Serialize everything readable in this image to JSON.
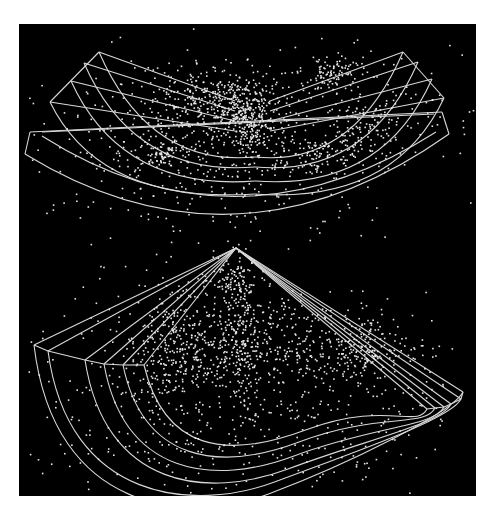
{
  "figure": {
    "background": "#000000",
    "wire_color": "#d8d8d8",
    "point_color": "#e6e6e6",
    "panel": {
      "x": 19,
      "y": 24,
      "width": 457,
      "height": 472
    }
  },
  "top_diagram": {
    "description": "Two intersecting 3D wedge slices of a galaxy redshift survey (V-shaped)",
    "apex": [
      236,
      82
    ],
    "left_wedge": {
      "outer_corners": [
        [
          80,
          28
        ],
        [
          65,
          39
        ],
        [
          52,
          57
        ],
        [
          31,
          78
        ]
      ],
      "inner_arcs_ctrl_y": [
        123,
        133,
        147,
        160
      ]
    },
    "right_wedge": {
      "outer_corners": [
        [
          384,
          28
        ],
        [
          399,
          38
        ],
        [
          413,
          55
        ],
        [
          425,
          74
        ]
      ],
      "inner_arcs_ctrl_y": [
        123,
        133,
        147,
        160
      ]
    },
    "front_wedge": {
      "left_end": [
        [
          11,
          108
        ],
        [
          6,
          130
        ]
      ],
      "right_end": [
        [
          423,
          88
        ],
        [
          430,
          110
        ]
      ],
      "arc_bottom_y": [
        190,
        205
      ]
    },
    "clusters": [
      {
        "cx": 218,
        "cy": 80,
        "sx": 22,
        "sy": 16,
        "n": 260
      },
      {
        "cx": 230,
        "cy": 100,
        "sx": 10,
        "sy": 14,
        "n": 120
      },
      {
        "cx": 175,
        "cy": 72,
        "sx": 28,
        "sy": 14,
        "n": 140
      },
      {
        "cx": 310,
        "cy": 46,
        "sx": 14,
        "sy": 8,
        "n": 80
      },
      {
        "cx": 145,
        "cy": 130,
        "sx": 14,
        "sy": 8,
        "n": 60
      },
      {
        "cx": 295,
        "cy": 130,
        "sx": 30,
        "sy": 10,
        "n": 110
      },
      {
        "cx": 345,
        "cy": 103,
        "sx": 14,
        "sy": 12,
        "n": 60
      },
      {
        "cx": 215,
        "cy": 130,
        "sx": 90,
        "sy": 40,
        "n": 340
      },
      {
        "cx": 150,
        "cy": 110,
        "sx": 70,
        "sy": 30,
        "n": 160
      },
      {
        "cx": 330,
        "cy": 85,
        "sx": 60,
        "sy": 30,
        "n": 160
      }
    ]
  },
  "bottom_diagram": {
    "description": "Fan-shaped stack of redshift survey slices viewed in perspective",
    "apex": [
      217,
      224
    ],
    "shells": [
      {
        "left": [
          15,
          321
        ],
        "right": [
          444,
          368
        ],
        "bottom_y": 500
      },
      {
        "left": [
          29,
          327
        ],
        "right": [
          442,
          375
        ],
        "bottom_y": 488
      },
      {
        "left": [
          66,
          336
        ],
        "right": [
          432,
          380
        ],
        "bottom_y": 475
      },
      {
        "left": [
          85,
          340
        ],
        "right": [
          425,
          383
        ],
        "bottom_y": 462
      },
      {
        "left": [
          104,
          341
        ],
        "right": [
          416,
          384
        ],
        "bottom_y": 448
      },
      {
        "left": [
          125,
          341
        ],
        "right": [
          408,
          385
        ],
        "bottom_y": 436
      }
    ],
    "clusters": [
      {
        "cx": 220,
        "cy": 300,
        "sx": 8,
        "sy": 45,
        "n": 170
      },
      {
        "cx": 198,
        "cy": 330,
        "sx": 40,
        "sy": 18,
        "n": 200
      },
      {
        "cx": 160,
        "cy": 305,
        "sx": 22,
        "sy": 25,
        "n": 150
      },
      {
        "cx": 320,
        "cy": 330,
        "sx": 40,
        "sy": 14,
        "n": 170
      },
      {
        "cx": 345,
        "cy": 320,
        "sx": 10,
        "sy": 18,
        "n": 70
      },
      {
        "cx": 210,
        "cy": 255,
        "sx": 14,
        "sy": 10,
        "n": 80
      },
      {
        "cx": 260,
        "cy": 300,
        "sx": 30,
        "sy": 20,
        "n": 100
      },
      {
        "cx": 230,
        "cy": 360,
        "sx": 110,
        "sy": 50,
        "n": 380
      },
      {
        "cx": 230,
        "cy": 410,
        "sx": 120,
        "sy": 30,
        "n": 160
      },
      {
        "cx": 140,
        "cy": 360,
        "sx": 20,
        "sy": 30,
        "n": 80
      }
    ]
  }
}
